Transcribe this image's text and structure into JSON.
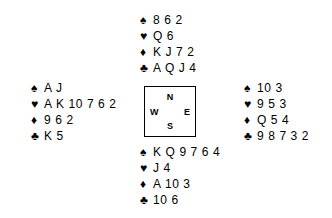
{
  "suits": {
    "spade": "♠",
    "heart": "♥",
    "diamond": "♦",
    "club": "♣"
  },
  "compass": {
    "north": "N",
    "west": "W",
    "east": "E",
    "south": "S"
  },
  "hands": {
    "north": {
      "label": "North",
      "spades": "8 6 2",
      "hearts": "Q 6",
      "diamonds": "K J 7 2",
      "clubs": "A Q J 4"
    },
    "west": {
      "label": "West",
      "spades": "A J",
      "hearts": "A K 10 7 6 2",
      "diamonds": "9 6 2",
      "clubs": "K 5"
    },
    "east": {
      "label": "East",
      "spades": "10 3",
      "hearts": "9 5 3",
      "diamonds": "Q 5 4",
      "clubs": "9 8 7 3 2"
    },
    "south": {
      "label": "South",
      "spades": "K Q 9 7 6 4",
      "hearts": "J 4",
      "diamonds": "A 10 3",
      "clubs": "10 6"
    }
  },
  "colors": {
    "ink": "#000000",
    "background": "#ffffff"
  }
}
